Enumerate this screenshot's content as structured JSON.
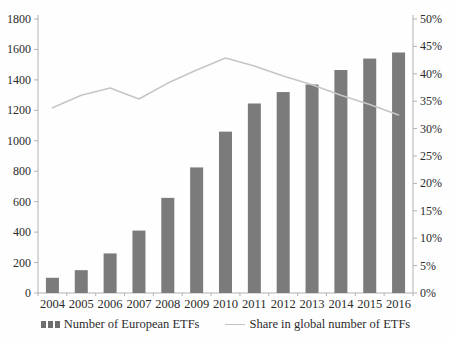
{
  "chart_data": {
    "type": "bar",
    "title": "",
    "categories": [
      "2004",
      "2005",
      "2006",
      "2007",
      "2008",
      "2009",
      "2010",
      "2011",
      "2012",
      "2013",
      "2014",
      "2015",
      "2016"
    ],
    "series": [
      {
        "name": "Number of European ETFs",
        "type": "bar",
        "axis": "left",
        "color": "#7b7b7b",
        "values": [
          100,
          150,
          260,
          410,
          625,
          825,
          1060,
          1245,
          1320,
          1370,
          1465,
          1540,
          1580
        ]
      },
      {
        "name": "Share in global number of ETFs",
        "type": "line",
        "axis": "right",
        "color": "#c6c6c6",
        "values": [
          33.8,
          36.1,
          37.4,
          35.4,
          38.3,
          40.7,
          42.9,
          41.4,
          39.6,
          38.0,
          36.1,
          34.4,
          32.5
        ]
      }
    ],
    "left_axis": {
      "min": 0,
      "max": 1800,
      "step": 200,
      "tick_labels": [
        "0",
        "200",
        "400",
        "600",
        "800",
        "1000",
        "1200",
        "1400",
        "1600",
        "1800"
      ]
    },
    "right_axis": {
      "min": 0,
      "max": 50,
      "step": 5,
      "tick_labels": [
        "0%",
        "5%",
        "10%",
        "15%",
        "20%",
        "25%",
        "30%",
        "35%",
        "40%",
        "45%",
        "50%"
      ]
    },
    "legend": [
      {
        "label": "Number of European ETFs",
        "swatch": "bar"
      },
      {
        "label": "Share in global number of ETFs",
        "swatch": "line"
      }
    ],
    "grid": "off",
    "legend_position": "bottom",
    "axis_line_color": "#b3b3b3"
  }
}
